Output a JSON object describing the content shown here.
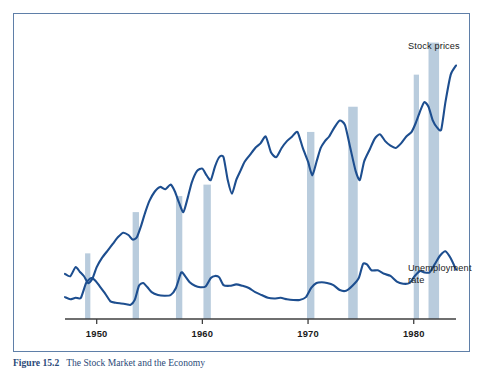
{
  "figure": {
    "caption_number": "Figure 15.2",
    "caption_text": "The Stock Market and the Economy",
    "border_color": "#5f7fa8"
  },
  "labels": {
    "stock_prices": "Stock prices",
    "unemployment_rate": "Unemployment\nrate"
  },
  "chart_data": {
    "type": "line",
    "title": "The Stock Market and the Economy",
    "xlabel": "",
    "ylabel": "",
    "grid": false,
    "legend_position": "right-inline-annotations",
    "xlim": [
      1947.0,
      1984.0
    ],
    "xticks": [
      1950,
      1960,
      1970,
      1980
    ],
    "xtick_labels": [
      "1950",
      "1960",
      "1970",
      "1980"
    ],
    "colors": {
      "line": "#1d4e8f",
      "recession_band": "#b9ccdd",
      "axis": "#3f3f3f"
    },
    "series": [
      {
        "name": "Stock prices",
        "color": "#1d4e8f",
        "x": [
          1947.0,
          1947.5,
          1948.0,
          1948.4,
          1948.8,
          1949.2,
          1949.6,
          1950.0,
          1950.5,
          1951.0,
          1951.5,
          1952.0,
          1952.5,
          1953.0,
          1953.4,
          1953.8,
          1954.2,
          1954.6,
          1955.0,
          1955.5,
          1956.0,
          1956.5,
          1957.0,
          1957.4,
          1957.8,
          1958.2,
          1958.6,
          1959.0,
          1959.5,
          1960.0,
          1960.4,
          1960.8,
          1961.2,
          1961.6,
          1962.0,
          1962.4,
          1962.8,
          1963.2,
          1963.6,
          1964.0,
          1964.5,
          1965.0,
          1965.5,
          1966.0,
          1966.5,
          1967.0,
          1967.5,
          1968.0,
          1968.5,
          1969.0,
          1969.5,
          1970.0,
          1970.4,
          1970.8,
          1971.2,
          1971.6,
          1972.0,
          1972.5,
          1973.0,
          1973.5,
          1974.0,
          1974.5,
          1974.9,
          1975.3,
          1975.8,
          1976.3,
          1976.8,
          1977.3,
          1977.8,
          1978.3,
          1978.8,
          1979.3,
          1979.8,
          1980.2,
          1980.6,
          1981.0,
          1981.4,
          1981.8,
          1982.2,
          1982.6,
          1983.0,
          1983.5,
          1984.0
        ],
        "y": [
          37,
          36,
          40,
          38,
          36,
          33,
          35,
          40,
          44,
          47,
          50,
          53,
          55,
          54,
          52,
          53,
          58,
          64,
          69,
          73,
          75,
          74,
          76,
          73,
          68,
          64,
          70,
          77,
          82,
          83,
          80,
          78,
          84,
          88,
          88,
          78,
          72,
          78,
          82,
          86,
          89,
          92,
          94,
          97,
          90,
          88,
          92,
          95,
          97,
          99,
          92,
          86,
          80,
          86,
          92,
          95,
          97,
          101,
          104,
          102,
          92,
          82,
          78,
          86,
          91,
          96,
          98,
          95,
          93,
          92,
          94,
          97,
          99,
          103,
          108,
          112,
          110,
          104,
          101,
          100,
          112,
          124,
          128
        ],
        "note": "Index level, unlabeled axis (relative scale)"
      },
      {
        "name": "Unemployment rate",
        "color": "#1d4e8f",
        "x": [
          1947.0,
          1947.5,
          1948.0,
          1948.5,
          1949.0,
          1949.5,
          1949.9,
          1950.3,
          1950.8,
          1951.3,
          1951.8,
          1952.3,
          1952.8,
          1953.2,
          1953.6,
          1954.0,
          1954.4,
          1954.8,
          1955.2,
          1955.8,
          1956.4,
          1957.0,
          1957.5,
          1958.0,
          1958.4,
          1958.8,
          1959.3,
          1959.8,
          1960.3,
          1960.8,
          1961.2,
          1961.6,
          1962.0,
          1962.6,
          1963.2,
          1963.8,
          1964.4,
          1965.0,
          1965.6,
          1966.2,
          1966.8,
          1967.4,
          1968.0,
          1968.6,
          1969.2,
          1969.8,
          1970.3,
          1970.8,
          1971.3,
          1971.8,
          1972.4,
          1973.0,
          1973.6,
          1974.2,
          1974.8,
          1975.2,
          1975.6,
          1976.0,
          1976.6,
          1977.2,
          1977.8,
          1978.4,
          1979.0,
          1979.6,
          1980.1,
          1980.6,
          1981.0,
          1981.5,
          1982.0,
          1982.5,
          1983.0,
          1983.5,
          1984.0
        ],
        "y": [
          3.9,
          3.6,
          3.8,
          3.8,
          5.9,
          6.6,
          6.2,
          5.4,
          4.4,
          3.3,
          3.1,
          3.0,
          2.9,
          2.8,
          3.5,
          5.5,
          5.9,
          5.3,
          4.6,
          4.2,
          4.1,
          4.2,
          5.2,
          7.4,
          6.8,
          6.0,
          5.5,
          5.3,
          5.4,
          6.6,
          6.9,
          6.7,
          5.6,
          5.5,
          5.7,
          5.5,
          5.2,
          4.6,
          4.2,
          3.8,
          3.7,
          3.8,
          3.6,
          3.5,
          3.5,
          3.9,
          5.2,
          5.9,
          6.0,
          5.9,
          5.6,
          4.9,
          4.8,
          5.5,
          6.6,
          8.6,
          8.5,
          7.7,
          7.7,
          7.2,
          6.9,
          6.1,
          5.8,
          5.9,
          6.9,
          7.6,
          7.4,
          7.4,
          8.6,
          9.8,
          10.4,
          9.4,
          7.8
        ],
        "note": "Percent, unlabeled axis (relative scale)"
      }
    ],
    "recession_bands": [
      {
        "start": 1948.9,
        "end": 1949.4,
        "top_value": 46
      },
      {
        "start": 1953.4,
        "end": 1954.0,
        "top_value": 64
      },
      {
        "start": 1957.5,
        "end": 1958.1,
        "top_value": 71
      },
      {
        "start": 1960.1,
        "end": 1960.8,
        "top_value": 76
      },
      {
        "start": 1969.9,
        "end": 1970.6,
        "top_value": 99
      },
      {
        "start": 1973.8,
        "end": 1974.7,
        "top_value": 110
      },
      {
        "start": 1980.0,
        "end": 1980.5,
        "top_value": 124
      },
      {
        "start": 1981.4,
        "end": 1982.4,
        "top_value": 138
      }
    ]
  }
}
